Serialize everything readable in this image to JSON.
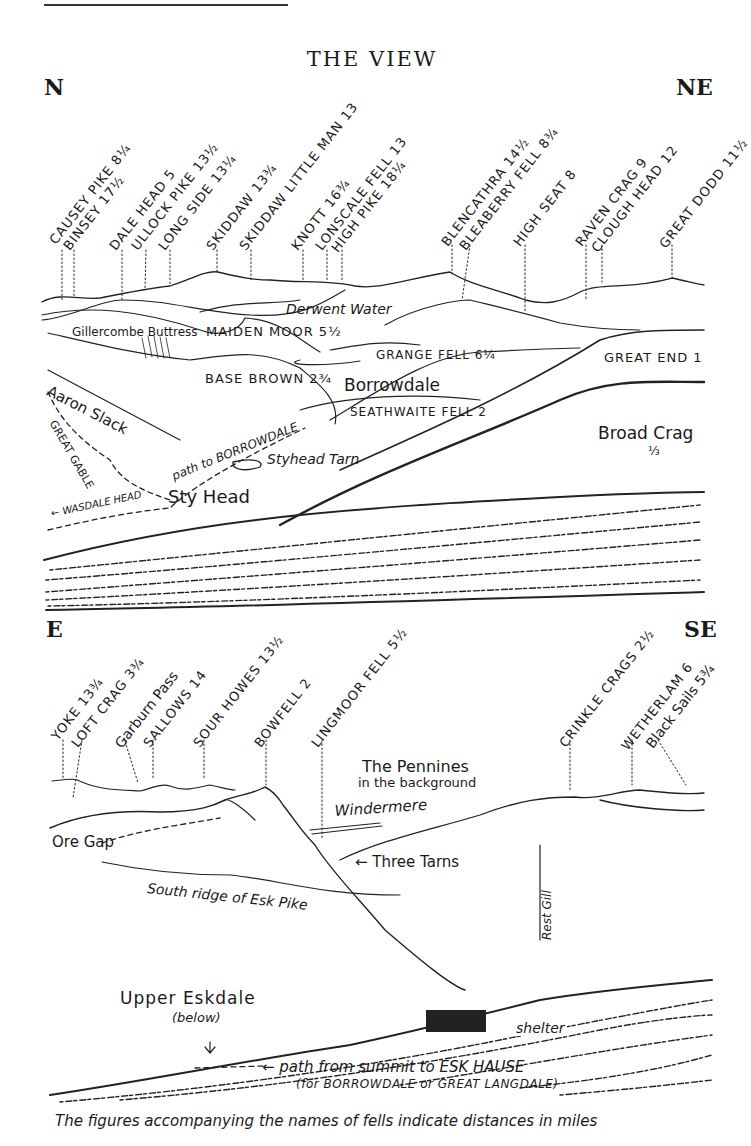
{
  "title": "THE VIEW",
  "panels": [
    {
      "from": "N",
      "to": "NE",
      "summits": [
        {
          "name": "CAUSEY PIKE",
          "dist": "8¼"
        },
        {
          "name": "BINSEY",
          "dist": "17½"
        },
        {
          "name": "DALE HEAD",
          "dist": "5"
        },
        {
          "name": "ULLOCK PIKE",
          "dist": "13½"
        },
        {
          "name": "LONG SIDE",
          "dist": "13¼"
        },
        {
          "name": "SKIDDAW",
          "dist": "13¾"
        },
        {
          "name": "SKIDDAW LITTLE MAN",
          "dist": "13"
        },
        {
          "name": "KNOTT",
          "dist": "16¾"
        },
        {
          "name": "LONSCALE FELL",
          "dist": "13"
        },
        {
          "name": "HIGH PIKE",
          "dist": "18¼"
        },
        {
          "name": "BLENCATHRA",
          "dist": "14½"
        },
        {
          "name": "BLEABERRY FELL",
          "dist": "8¾"
        },
        {
          "name": "HIGH SEAT",
          "dist": "8"
        },
        {
          "name": "RAVEN CRAG",
          "dist": "9"
        },
        {
          "name": "CLOUGH HEAD",
          "dist": "12"
        },
        {
          "name": "GREAT DODD",
          "dist": "11½"
        }
      ],
      "features": {
        "derwent_water": "Derwent Water",
        "gillercombe": "Gillercombe Buttress",
        "maiden_moor": "MAIDEN MOOR 5½",
        "grange_fell": "GRANGE FELL 6¼",
        "base_brown": "BASE BROWN 2¾",
        "borrowdale": "Borrowdale",
        "great_end": "GREAT END 1",
        "aaron_slack": "Aaron Slack",
        "great_gable": "GREAT GABLE",
        "seathwaite_fell": "SEATHWAITE FELL 2",
        "path_borrowdale": "path to BORROWDALE",
        "styhead_tarn": "Styhead Tarn",
        "broad_crag": "Broad Crag",
        "broad_crag_dist": "⅓",
        "sty_head": "Sty Head",
        "wasdale_head": "← WASDALE HEAD"
      }
    },
    {
      "from": "E",
      "to": "SE",
      "summits": [
        {
          "name": "YOKE",
          "dist": "13¾"
        },
        {
          "name": "LOFT CRAG",
          "dist": "3¾"
        },
        {
          "name": "Garburn Pass",
          "dist": ""
        },
        {
          "name": "SALLOWS",
          "dist": "14"
        },
        {
          "name": "SOUR HOWES",
          "dist": "13½"
        },
        {
          "name": "BOWFELL",
          "dist": "2"
        },
        {
          "name": "LINGMOOR FELL",
          "dist": "5½"
        },
        {
          "name": "CRINKLE CRAGS",
          "dist": "2½"
        },
        {
          "name": "WETHERLAM",
          "dist": "6"
        },
        {
          "name": "Black Sails",
          "dist": "5¾"
        }
      ],
      "features": {
        "pennines": "The Pennines",
        "pennines_sub": "in the background",
        "windermere": "Windermere",
        "ore_gap": "Ore Gap",
        "three_tarns": "← Three Tarns",
        "south_ridge": "South ridge of Esk Pike",
        "rest_gill": "Rest Gill",
        "upper_eskdale": "Upper Eskdale",
        "below": "(below)",
        "shelter": "shelter",
        "path_summit": "← path from summit to ESK HAUSE",
        "path_sub": "(for BORROWDALE or GREAT LANGDALE)"
      }
    }
  ],
  "caption": "The figures accompanying the names of fells indicate distances in miles"
}
